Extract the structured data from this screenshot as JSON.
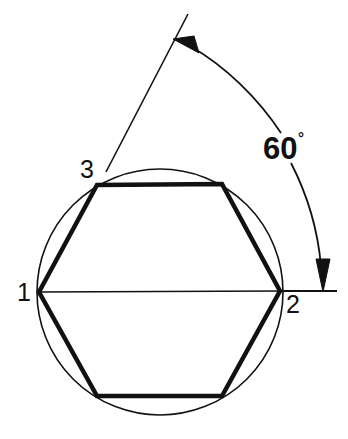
{
  "figure": {
    "background_color": "#ffffff",
    "stroke_color": "#111111",
    "canvas": {
      "width": 348,
      "height": 439
    }
  },
  "circle": {
    "name": "circumscribed-circle",
    "center_x": 160,
    "center_y": 292,
    "radius": 123,
    "stroke_width": 1.6
  },
  "hexagon": {
    "name": "inscribed-hexagon",
    "stroke_width": 4.5,
    "points": "39,292 97,185 222,184 280,291 222,396 97,396",
    "vertices": [
      {
        "id": "1",
        "x": 39,
        "y": 292
      },
      {
        "id": "3",
        "x": 97,
        "y": 185
      },
      {
        "id": "top-right",
        "x": 222,
        "y": 184
      },
      {
        "id": "2",
        "x": 280,
        "y": 291
      },
      {
        "id": "bottom-right",
        "x": 222,
        "y": 396
      },
      {
        "id": "bottom-left",
        "x": 97,
        "y": 396
      }
    ]
  },
  "diameter_line": {
    "name": "horizontal-diameter",
    "x1": 39,
    "y1": 292,
    "x2": 280,
    "y2": 291,
    "stroke_width": 1.4
  },
  "reference_line_horizontal": {
    "name": "horizontal-reference-line",
    "x1": 280,
    "y1": 291,
    "x2": 337,
    "y2": 291,
    "stroke_width": 1.8
  },
  "reference_line_slanted": {
    "name": "slanted-reference-line",
    "x1": 106,
    "y1": 172,
    "x2": 188,
    "y2": 14,
    "stroke_width": 1.6
  },
  "angle_arc": {
    "name": "sixty-degree-arc",
    "upper_path": "M 190,46 C 225,66 258,98 281,133",
    "lower_path": "M 291,163 C 308,196 318,232 321,266",
    "stroke_width": 1.8
  },
  "arrowheads": [
    {
      "name": "arrowhead-upper",
      "points": "173,39 199,53 194,36",
      "rotation_hint": "points up-left along arc"
    },
    {
      "name": "arrowhead-lower",
      "points": "323,292 316,259 330,259",
      "rotation_hint": "points down to horizontal line"
    }
  ],
  "labels": {
    "vertex_1": {
      "text": "1",
      "x": 17,
      "y": 301
    },
    "vertex_2": {
      "text": "2",
      "x": 286,
      "y": 313
    },
    "vertex_3": {
      "text": "3",
      "x": 80,
      "y": 178
    },
    "angle_value": {
      "text": "60",
      "x": 263,
      "y": 159
    },
    "angle_degree_symbol": {
      "text": "°",
      "x": 298,
      "y": 143
    }
  }
}
